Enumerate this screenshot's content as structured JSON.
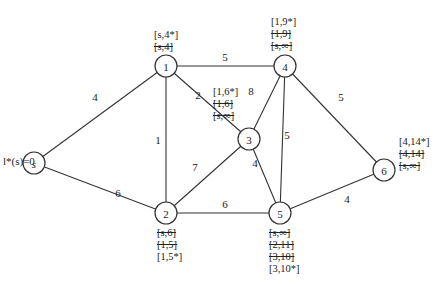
{
  "initial_label": "l*(s)=0",
  "nodes": [
    {
      "id": "s",
      "x": 34,
      "y": 163,
      "italic": true
    },
    {
      "id": "1",
      "x": 166,
      "y": 66
    },
    {
      "id": "2",
      "x": 166,
      "y": 213
    },
    {
      "id": "3",
      "x": 249,
      "y": 139
    },
    {
      "id": "4",
      "x": 285,
      "y": 66
    },
    {
      "id": "5",
      "x": 280,
      "y": 213
    },
    {
      "id": "6",
      "x": 384,
      "y": 170
    }
  ],
  "edges": [
    {
      "from": "s",
      "to": "1",
      "weight": "4",
      "lx": 95,
      "ly": 97
    },
    {
      "from": "s",
      "to": "2",
      "weight": "6",
      "lx": 118,
      "ly": 193
    },
    {
      "from": "1",
      "to": "4",
      "weight": "5",
      "lx": 225,
      "ly": 57
    },
    {
      "from": "1",
      "to": "2",
      "weight": "1",
      "lx": 158,
      "ly": 140
    },
    {
      "from": "1",
      "to": "3",
      "weight": "2",
      "lx": 198,
      "ly": 95
    },
    {
      "from": "3",
      "to": "4",
      "weight": "8",
      "lx": 251,
      "ly": 91
    },
    {
      "from": "2",
      "to": "3",
      "weight": "7",
      "lx": 195,
      "ly": 167
    },
    {
      "from": "3",
      "to": "5",
      "weight": "4",
      "lx": 255,
      "ly": 163
    },
    {
      "from": "4",
      "to": "5",
      "weight": "5",
      "lx": 287,
      "ly": 135
    },
    {
      "from": "2",
      "to": "5",
      "weight": "6",
      "lx": 225,
      "ly": 204
    },
    {
      "from": "4",
      "to": "6",
      "weight": "5",
      "lx": 341,
      "ly": 97
    },
    {
      "from": "5",
      "to": "6",
      "weight": "4",
      "lx": 347,
      "ly": 199
    }
  ],
  "labels": {
    "n1": {
      "final": "[s,4*]",
      "struck": [
        "[s,4]"
      ]
    },
    "n4": {
      "final": "[1,9*]",
      "struck": [
        "[1,9]",
        "[s,∞]"
      ]
    },
    "n3": {
      "final": "[1,6*]",
      "struck": [
        "[1,6]",
        "[s,∞]"
      ]
    },
    "n6": {
      "final": "[4,14*]",
      "struck": [
        "[4,14]",
        "[s,∞]"
      ]
    },
    "n2": {
      "struck": [
        "[s,6]",
        "[1,5]"
      ],
      "final": "[1,5*]"
    },
    "n5": {
      "struck": [
        "[s,∞]",
        "[2,11]",
        "[3,10]"
      ],
      "final": "[3,10*]"
    }
  },
  "colors": {
    "ink": "#333333",
    "background": "#ffffff"
  }
}
